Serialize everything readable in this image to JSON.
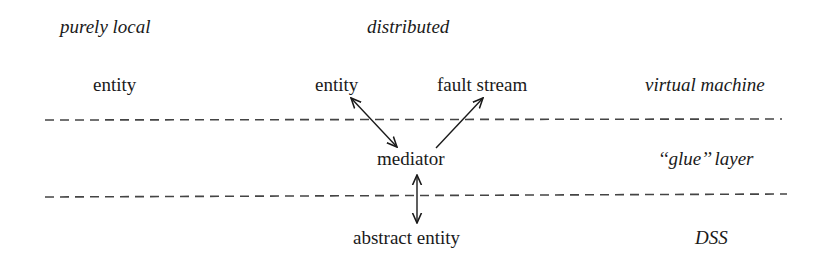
{
  "diagram": {
    "column_headers": {
      "left": "purely local",
      "center": "distributed"
    },
    "layer_labels": {
      "top": "virtual machine",
      "middle": "‘‘glue’’ layer",
      "bottom": "DSS"
    },
    "nodes": {
      "local_entity": "entity",
      "distributed_entity": "entity",
      "fault_stream": "fault stream",
      "mediator": "mediator",
      "abstract_entity": "abstract entity"
    },
    "edges": [
      {
        "from": "distributed_entity",
        "to": "mediator",
        "direction": "both"
      },
      {
        "from": "mediator",
        "to": "fault_stream",
        "direction": "forward"
      },
      {
        "from": "mediator",
        "to": "abstract_entity",
        "direction": "both"
      }
    ],
    "separators": [
      {
        "style": "dashed",
        "between": [
          "virtual machine",
          "glue layer"
        ]
      },
      {
        "style": "dashed",
        "between": [
          "glue layer",
          "DSS"
        ]
      }
    ],
    "colors": {
      "ink": "#1a1a1a",
      "dash": "#444444",
      "background": "#ffffff"
    }
  }
}
